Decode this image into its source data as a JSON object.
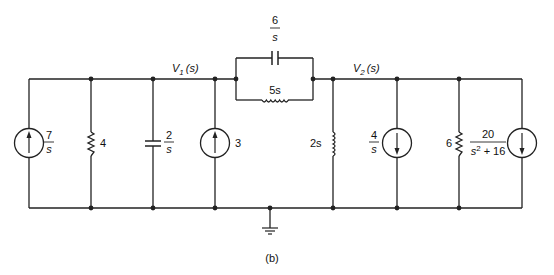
{
  "figure": {
    "caption": "(b)",
    "type": "s-domain circuit schematic"
  },
  "nodes": {
    "v1": {
      "label_main": "V",
      "label_sub": "1",
      "label_arg": "(s)"
    },
    "v2": {
      "label_main": "V",
      "label_sub": "2",
      "label_arg": "(s)"
    },
    "ground": {
      "label": "ground"
    }
  },
  "components": {
    "src_7_over_s": {
      "kind": "current source",
      "direction": "up",
      "num": "7",
      "den": "s"
    },
    "r_4": {
      "kind": "resistor",
      "value": "4"
    },
    "c_2_over_s": {
      "kind": "capacitor",
      "num": "2",
      "den": "s"
    },
    "src_3": {
      "kind": "current source",
      "direction": "up",
      "value": "3"
    },
    "c_6_over_s": {
      "kind": "capacitor",
      "num": "6",
      "den": "s"
    },
    "l_5s": {
      "kind": "inductor",
      "value": "5s"
    },
    "l_2s": {
      "kind": "inductor",
      "value": "2s"
    },
    "src_4_over_s": {
      "kind": "current source",
      "direction": "down",
      "num": "4",
      "den": "s"
    },
    "r_6": {
      "kind": "resistor",
      "value": "6"
    },
    "src_20": {
      "kind": "current source",
      "direction": "down",
      "num": "20",
      "den_a": "s",
      "den_exp": "2",
      "den_b": " + 16"
    }
  },
  "colors": {
    "ink": "#222222",
    "background": "#ffffff"
  }
}
